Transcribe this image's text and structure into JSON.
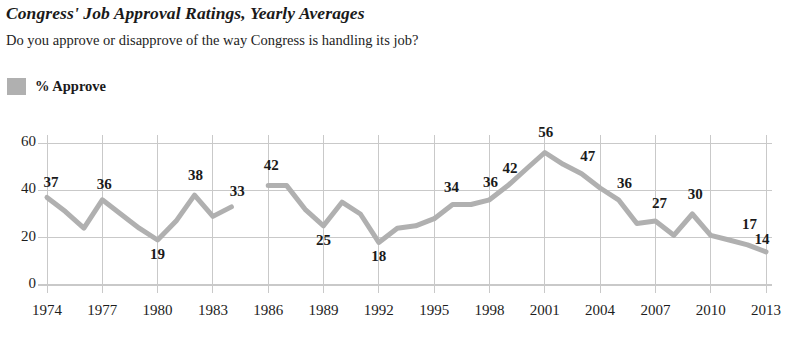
{
  "header": {
    "title": "Congress' Job Approval Ratings, Yearly Averages",
    "subtitle": "Do you approve or disapprove of the way Congress is handling its job?"
  },
  "legend": {
    "swatch_color": "#b0b0b0",
    "label": "% Approve"
  },
  "chart_data": {
    "type": "line",
    "title": "Congress' Job Approval Ratings, Yearly Averages",
    "subtitle": "Do you approve or disapprove of the way Congress is handling its job?",
    "xlabel": "",
    "ylabel": "",
    "ylim": [
      0,
      65
    ],
    "xlim": [
      1973,
      2014
    ],
    "yticks": [
      0,
      20,
      40,
      60
    ],
    "ytick_labels": [
      "0",
      "20",
      "40",
      "60"
    ],
    "xticks": [
      1974,
      1977,
      1980,
      1983,
      1986,
      1989,
      1992,
      1995,
      1998,
      2001,
      2004,
      2007,
      2010,
      2013
    ],
    "xtick_labels": [
      "1974",
      "1977",
      "1980",
      "1983",
      "1986",
      "1989",
      "1992",
      "1995",
      "1998",
      "2001",
      "2004",
      "2007",
      "2010",
      "2013"
    ],
    "grid": true,
    "grid_color": "#c9c9c9",
    "line_color": "#b0b0b0",
    "line_width": 5,
    "legend_position": "top-left",
    "series": [
      {
        "name": "% Approve",
        "gap_years": [
          1985
        ],
        "points": [
          {
            "x": 1974,
            "y": 37,
            "label": "37"
          },
          {
            "x": 1975,
            "y": 31,
            "label": null
          },
          {
            "x": 1976,
            "y": 24,
            "label": null
          },
          {
            "x": 1977,
            "y": 36,
            "label": "36"
          },
          {
            "x": 1978,
            "y": 30,
            "label": null
          },
          {
            "x": 1979,
            "y": 24,
            "label": null
          },
          {
            "x": 1980,
            "y": 19,
            "label": "19"
          },
          {
            "x": 1981,
            "y": 27,
            "label": null
          },
          {
            "x": 1982,
            "y": 38,
            "label": "38"
          },
          {
            "x": 1983,
            "y": 29,
            "label": null
          },
          {
            "x": 1984,
            "y": 33,
            "label": "33"
          },
          {
            "x": 1986,
            "y": 42,
            "label": "42"
          },
          {
            "x": 1987,
            "y": 42,
            "label": null
          },
          {
            "x": 1988,
            "y": 32,
            "label": null
          },
          {
            "x": 1989,
            "y": 25,
            "label": "25"
          },
          {
            "x": 1990,
            "y": 35,
            "label": null
          },
          {
            "x": 1991,
            "y": 30,
            "label": null
          },
          {
            "x": 1992,
            "y": 18,
            "label": "18"
          },
          {
            "x": 1993,
            "y": 24,
            "label": null
          },
          {
            "x": 1994,
            "y": 25,
            "label": null
          },
          {
            "x": 1995,
            "y": 28,
            "label": null
          },
          {
            "x": 1996,
            "y": 34,
            "label": "34"
          },
          {
            "x": 1997,
            "y": 34,
            "label": null
          },
          {
            "x": 1998,
            "y": 36,
            "label": "36"
          },
          {
            "x": 1999,
            "y": 42,
            "label": "42"
          },
          {
            "x": 2000,
            "y": 49,
            "label": null
          },
          {
            "x": 2001,
            "y": 56,
            "label": "56"
          },
          {
            "x": 2002,
            "y": 51,
            "label": null
          },
          {
            "x": 2003,
            "y": 47,
            "label": "47"
          },
          {
            "x": 2004,
            "y": 41,
            "label": null
          },
          {
            "x": 2005,
            "y": 36,
            "label": "36"
          },
          {
            "x": 2006,
            "y": 26,
            "label": null
          },
          {
            "x": 2007,
            "y": 27,
            "label": "27"
          },
          {
            "x": 2008,
            "y": 21,
            "label": null
          },
          {
            "x": 2009,
            "y": 30,
            "label": "30"
          },
          {
            "x": 2010,
            "y": 21,
            "label": null
          },
          {
            "x": 2011,
            "y": 19,
            "label": null
          },
          {
            "x": 2012,
            "y": 17,
            "label": "17"
          },
          {
            "x": 2013,
            "y": 14,
            "label": "14"
          }
        ]
      }
    ]
  }
}
